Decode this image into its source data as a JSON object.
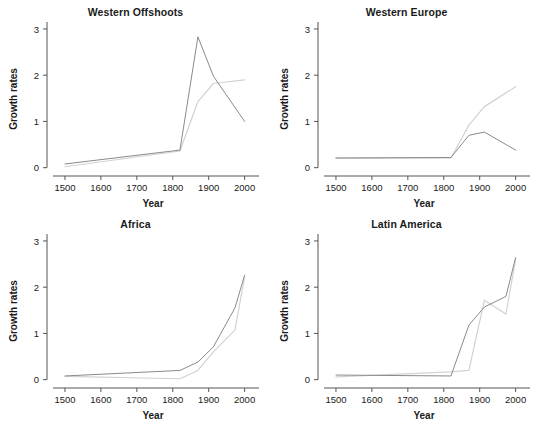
{
  "figure": {
    "width": 542,
    "height": 424,
    "background": "#ffffff",
    "layout": "2x2 small multiples"
  },
  "chart_data": [
    {
      "type": "line",
      "title": "Western Offshoots",
      "xlabel": "Year",
      "ylabel": "Growth rates",
      "xlim": [
        1450,
        2040
      ],
      "ylim": [
        -0.18,
        3.15
      ],
      "xticks": [
        1500,
        1600,
        1700,
        1800,
        1900,
        2000
      ],
      "yticks": [
        0,
        1,
        2,
        3
      ],
      "xticklabels": [
        "1500",
        "1600",
        "1700",
        "1800",
        "1900",
        "2000"
      ],
      "yticklabels": [
        "0",
        "1",
        "2",
        "3"
      ],
      "grid": false,
      "legend": "none",
      "series": [
        {
          "name": "dark",
          "color": "#8a8a8a",
          "x": [
            1500,
            1820,
            1870,
            1913,
            2000
          ],
          "values": [
            0.08,
            0.38,
            2.83,
            1.98,
            1.0
          ]
        },
        {
          "name": "light",
          "color": "#d2d2d2",
          "x": [
            1500,
            1820,
            1870,
            1913,
            2000
          ],
          "values": [
            0.02,
            0.36,
            1.43,
            1.82,
            1.9
          ]
        }
      ]
    },
    {
      "type": "line",
      "title": "Western Europe",
      "xlabel": "Year",
      "ylabel": "Growth rates",
      "xlim": [
        1450,
        2040
      ],
      "ylim": [
        -0.18,
        3.15
      ],
      "xticks": [
        1500,
        1600,
        1700,
        1800,
        1900,
        2000
      ],
      "yticks": [
        0,
        1,
        2,
        3
      ],
      "xticklabels": [
        "1500",
        "1600",
        "1700",
        "1800",
        "1900",
        "2000"
      ],
      "yticklabels": [
        "0",
        "1",
        "2",
        "3"
      ],
      "grid": false,
      "legend": "none",
      "series": [
        {
          "name": "dark",
          "color": "#8a8a8a",
          "x": [
            1500,
            1820,
            1870,
            1913,
            2000
          ],
          "values": [
            0.21,
            0.22,
            0.7,
            0.77,
            0.38
          ]
        },
        {
          "name": "light",
          "color": "#d2d2d2",
          "x": [
            1500,
            1820,
            1870,
            1913,
            2000
          ],
          "values": [
            0.2,
            0.21,
            0.92,
            1.32,
            1.75
          ]
        }
      ]
    },
    {
      "type": "line",
      "title": "Africa",
      "xlabel": "Year",
      "ylabel": "Growth rates",
      "xlim": [
        1450,
        2040
      ],
      "ylim": [
        -0.18,
        3.15
      ],
      "xticks": [
        1500,
        1600,
        1700,
        1800,
        1900,
        2000
      ],
      "yticks": [
        0,
        1,
        2,
        3
      ],
      "xticklabels": [
        "1500",
        "1600",
        "1700",
        "1800",
        "1900",
        "2000"
      ],
      "yticklabels": [
        "0",
        "1",
        "2",
        "3"
      ],
      "grid": false,
      "legend": "none",
      "series": [
        {
          "name": "dark",
          "color": "#8a8a8a",
          "x": [
            1500,
            1820,
            1870,
            1913,
            1973,
            2000
          ],
          "values": [
            0.08,
            0.2,
            0.38,
            0.71,
            1.55,
            2.26
          ]
        },
        {
          "name": "light",
          "color": "#d2d2d2",
          "x": [
            1500,
            1820,
            1870,
            1913,
            1973,
            2000
          ],
          "values": [
            0.07,
            0.02,
            0.2,
            0.6,
            1.07,
            2.22
          ]
        }
      ]
    },
    {
      "type": "line",
      "title": "Latin America",
      "xlabel": "Year",
      "ylabel": "Growth rates",
      "xlim": [
        1450,
        2040
      ],
      "ylim": [
        -0.18,
        3.15
      ],
      "xticks": [
        1500,
        1600,
        1700,
        1800,
        1900,
        2000
      ],
      "yticks": [
        0,
        1,
        2,
        3
      ],
      "xticklabels": [
        "1500",
        "1600",
        "1700",
        "1800",
        "1900",
        "2000"
      ],
      "yticklabels": [
        "0",
        "1",
        "2",
        "3"
      ],
      "grid": false,
      "legend": "none",
      "series": [
        {
          "name": "dark",
          "color": "#8a8a8a",
          "x": [
            1500,
            1820,
            1870,
            1913,
            1973,
            2000
          ],
          "values": [
            0.1,
            0.08,
            1.18,
            1.57,
            1.8,
            2.64
          ]
        },
        {
          "name": "light",
          "color": "#d2d2d2",
          "x": [
            1500,
            1820,
            1870,
            1913,
            1973,
            2000
          ],
          "values": [
            0.06,
            0.17,
            0.2,
            1.72,
            1.42,
            2.6
          ]
        }
      ]
    }
  ]
}
